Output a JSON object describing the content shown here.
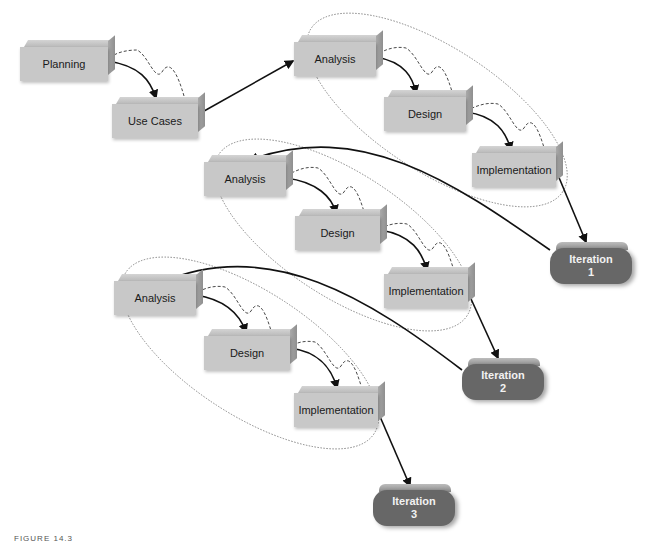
{
  "diagram": {
    "start_nodes": [
      {
        "id": "planning",
        "label": "Planning"
      },
      {
        "id": "use_cases",
        "label": "Use Cases"
      }
    ],
    "iterations": [
      {
        "number": "1",
        "label": "Iteration",
        "phases": [
          "Analysis",
          "Design",
          "Implementation"
        ]
      },
      {
        "number": "2",
        "label": "Iteration",
        "phases": [
          "Analysis",
          "Design",
          "Implementation"
        ]
      },
      {
        "number": "3",
        "label": "Iteration",
        "phases": [
          "Analysis",
          "Design",
          "Implementation"
        ]
      }
    ],
    "edges": [
      {
        "from": "Planning",
        "to": "Use Cases",
        "style": "solid",
        "feedback": "dashed"
      },
      {
        "from": "Use Cases",
        "to": "Iteration 1 Analysis",
        "style": "solid"
      },
      {
        "from": "Analysis",
        "to": "Design",
        "style": "solid",
        "feedback": "dashed"
      },
      {
        "from": "Design",
        "to": "Implementation",
        "style": "solid",
        "feedback": "dashed"
      },
      {
        "from": "Iteration 1 Implementation",
        "to": "Iteration 1",
        "style": "solid"
      },
      {
        "from": "Iteration 1",
        "to": "Iteration 2 Analysis",
        "style": "solid"
      },
      {
        "from": "Iteration 2 Implementation",
        "to": "Iteration 2",
        "style": "solid"
      },
      {
        "from": "Iteration 2",
        "to": "Iteration 3 Analysis",
        "style": "solid"
      },
      {
        "from": "Iteration 3 Implementation",
        "to": "Iteration 3",
        "style": "solid"
      }
    ],
    "caption": "FIGURE 14.3"
  }
}
